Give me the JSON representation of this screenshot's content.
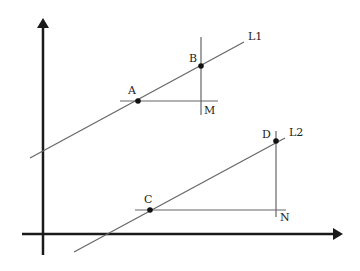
{
  "diagram": {
    "colors": {
      "axis": "#1a1a1a",
      "line": "#666666",
      "point": "#111111",
      "text": "#222222",
      "background": "#ffffff"
    },
    "axes": {
      "y_axis": {
        "x": 43,
        "y_start": 255,
        "y_end": 18
      },
      "x_axis": {
        "y": 234,
        "x_start": 22,
        "x_end": 343
      }
    },
    "lines": [
      {
        "name": "L1",
        "label": "L1",
        "x1": 30,
        "y1": 158,
        "x2": 244,
        "y2": 42,
        "label_x": 248,
        "label_y": 40
      },
      {
        "name": "L2",
        "label": "L2",
        "x1": 74,
        "y1": 252,
        "x2": 285,
        "y2": 138,
        "label_x": 289,
        "label_y": 136
      }
    ],
    "points": [
      {
        "label": "A",
        "x": 138,
        "y": 101,
        "label_x": 128,
        "label_y": 94
      },
      {
        "label": "B",
        "x": 201,
        "y": 66,
        "label_x": 189,
        "label_y": 62
      },
      {
        "label": "C",
        "x": 150,
        "y": 210,
        "label_x": 144,
        "label_y": 203
      },
      {
        "label": "D",
        "x": 276,
        "y": 141,
        "label_x": 262,
        "label_y": 138
      }
    ],
    "construction_lines": [
      {
        "name": "horizontal-through-A",
        "x1": 120,
        "y1": 101,
        "x2": 218,
        "y2": 101
      },
      {
        "name": "vertical-through-B",
        "x1": 201,
        "y1": 37,
        "x2": 201,
        "y2": 115
      },
      {
        "name": "horizontal-through-C",
        "x1": 135,
        "y1": 210,
        "x2": 286,
        "y2": 210
      },
      {
        "name": "vertical-through-D",
        "x1": 276,
        "y1": 131,
        "x2": 276,
        "y2": 217
      }
    ],
    "corner_labels": [
      {
        "label": "M",
        "x": 204,
        "y": 114
      },
      {
        "label": "N",
        "x": 280,
        "y": 221
      }
    ]
  }
}
